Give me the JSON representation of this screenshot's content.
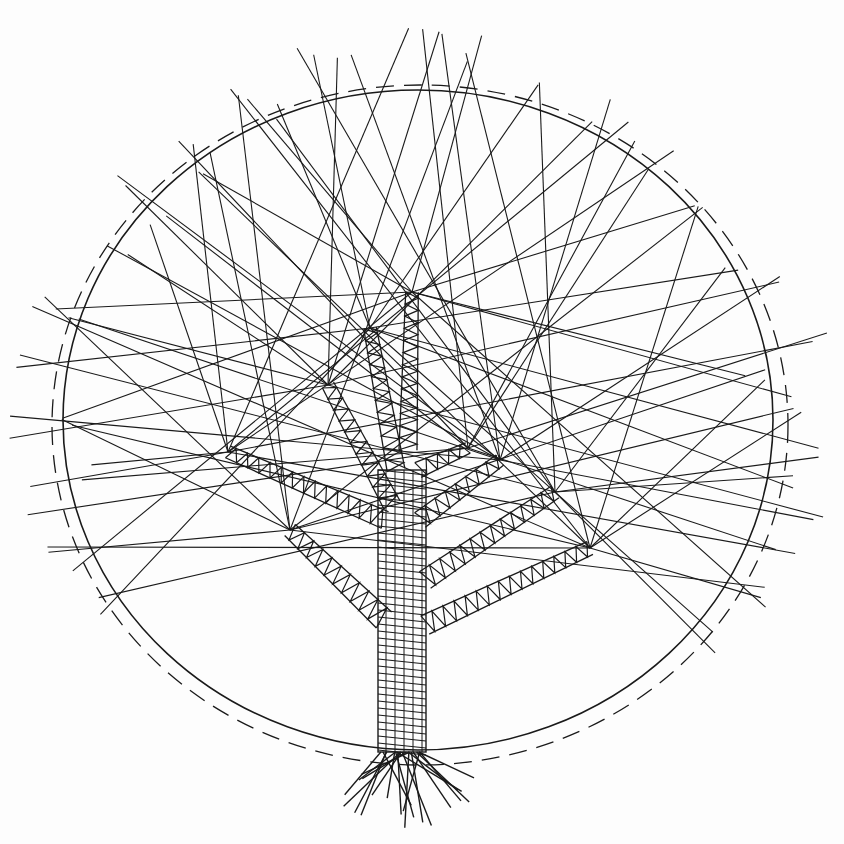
{
  "image": {
    "subject": "string-art style ink drawing of a tree inside a circle",
    "width": 844,
    "height": 844,
    "background": "#fdfdfd",
    "ink_color": "#1a1a1a"
  },
  "circle": {
    "solid": {
      "cx": 418,
      "cy": 420,
      "rx": 355,
      "ry": 330
    },
    "dashed": {
      "cx": 420,
      "cy": 425,
      "rx": 368,
      "ry": 340,
      "dash": "18 10"
    }
  },
  "trunk": {
    "x1": 378,
    "x2": 426,
    "top": 470,
    "bottom": 752
  },
  "branches": [
    {
      "from": [
        384,
        620
      ],
      "to": [
        290,
        530
      ],
      "width": 22
    },
    {
      "from": [
        385,
        520
      ],
      "to": [
        228,
        452
      ],
      "width": 18
    },
    {
      "from": [
        392,
        505
      ],
      "to": [
        328,
        385
      ],
      "width": 18
    },
    {
      "from": [
        396,
        470
      ],
      "to": [
        370,
        328
      ],
      "width": 18
    },
    {
      "from": [
        408,
        450
      ],
      "to": [
        412,
        292
      ],
      "width": 18
    },
    {
      "from": [
        418,
        470
      ],
      "to": [
        468,
        448
      ],
      "width": 16
    },
    {
      "from": [
        420,
        520
      ],
      "to": [
        500,
        460
      ],
      "width": 18
    },
    {
      "from": [
        425,
        580
      ],
      "to": [
        555,
        492
      ],
      "width": 20
    },
    {
      "from": [
        425,
        625
      ],
      "to": [
        590,
        548
      ],
      "width": 20
    }
  ],
  "root_fan": {
    "origin": [
      400,
      752
    ],
    "count": 22,
    "spread": [
      205,
      335
    ],
    "length": [
      45,
      80
    ]
  },
  "rays": {
    "tips": [
      [
        290,
        530
      ],
      [
        228,
        452
      ],
      [
        328,
        385
      ],
      [
        370,
        328
      ],
      [
        412,
        292
      ],
      [
        468,
        448
      ],
      [
        500,
        460
      ],
      [
        555,
        492
      ],
      [
        590,
        548
      ]
    ],
    "targets": [
      [
        45,
        295
      ],
      [
        30,
        370
      ],
      [
        20,
        430
      ],
      [
        40,
        500
      ],
      [
        60,
        560
      ],
      [
        95,
        610
      ],
      [
        130,
        190
      ],
      [
        180,
        130
      ],
      [
        240,
        95
      ],
      [
        300,
        60
      ],
      [
        350,
        45
      ],
      [
        420,
        30
      ],
      [
        480,
        50
      ],
      [
        540,
        85
      ],
      [
        600,
        110
      ],
      [
        660,
        160
      ],
      [
        700,
        210
      ],
      [
        740,
        260
      ],
      [
        780,
        290
      ],
      [
        815,
        340
      ],
      [
        800,
        400
      ],
      [
        820,
        450
      ],
      [
        820,
        520
      ],
      [
        790,
        560
      ],
      [
        760,
        600
      ],
      [
        720,
        640
      ],
      [
        120,
        250
      ],
      [
        160,
        210
      ],
      [
        210,
        160
      ],
      [
        270,
        115
      ],
      [
        450,
        40
      ],
      [
        630,
        130
      ],
      [
        760,
        380
      ],
      [
        800,
        480
      ],
      [
        70,
        330
      ],
      [
        90,
        470
      ],
      [
        60,
        420
      ]
    ]
  }
}
